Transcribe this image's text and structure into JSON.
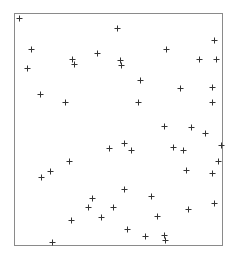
{
  "chart_data": {
    "type": "scatter",
    "title": "",
    "xlabel": "",
    "ylabel": "",
    "xlim": [
      0,
      1
    ],
    "ylim": [
      0,
      1
    ],
    "grid": false,
    "legend": null,
    "marker": "+",
    "series": [
      {
        "name": "points",
        "color": "#333333",
        "points": [
          {
            "x": 0.024,
            "y": 0.978
          },
          {
            "x": 0.495,
            "y": 0.935
          },
          {
            "x": 0.082,
            "y": 0.845
          },
          {
            "x": 0.279,
            "y": 0.802
          },
          {
            "x": 0.288,
            "y": 0.78
          },
          {
            "x": 0.399,
            "y": 0.828
          },
          {
            "x": 0.51,
            "y": 0.797
          },
          {
            "x": 0.514,
            "y": 0.776
          },
          {
            "x": 0.731,
            "y": 0.845
          },
          {
            "x": 0.962,
            "y": 0.884
          },
          {
            "x": 0.889,
            "y": 0.802
          },
          {
            "x": 0.971,
            "y": 0.802
          },
          {
            "x": 0.063,
            "y": 0.763
          },
          {
            "x": 0.606,
            "y": 0.711
          },
          {
            "x": 0.798,
            "y": 0.677
          },
          {
            "x": 0.952,
            "y": 0.681
          },
          {
            "x": 0.125,
            "y": 0.651
          },
          {
            "x": 0.245,
            "y": 0.616
          },
          {
            "x": 0.596,
            "y": 0.616
          },
          {
            "x": 0.952,
            "y": 0.616
          },
          {
            "x": 0.721,
            "y": 0.513
          },
          {
            "x": 0.851,
            "y": 0.509
          },
          {
            "x": 0.918,
            "y": 0.483
          },
          {
            "x": 0.457,
            "y": 0.418
          },
          {
            "x": 0.529,
            "y": 0.44
          },
          {
            "x": 0.563,
            "y": 0.41
          },
          {
            "x": 0.764,
            "y": 0.422
          },
          {
            "x": 0.813,
            "y": 0.41
          },
          {
            "x": 0.995,
            "y": 0.431
          },
          {
            "x": 0.981,
            "y": 0.362
          },
          {
            "x": 0.827,
            "y": 0.323
          },
          {
            "x": 0.952,
            "y": 0.31
          },
          {
            "x": 0.264,
            "y": 0.362
          },
          {
            "x": 0.173,
            "y": 0.319
          },
          {
            "x": 0.13,
            "y": 0.293
          },
          {
            "x": 0.529,
            "y": 0.241
          },
          {
            "x": 0.375,
            "y": 0.203
          },
          {
            "x": 0.476,
            "y": 0.164
          },
          {
            "x": 0.356,
            "y": 0.164
          },
          {
            "x": 0.418,
            "y": 0.121
          },
          {
            "x": 0.659,
            "y": 0.211
          },
          {
            "x": 0.837,
            "y": 0.155
          },
          {
            "x": 0.962,
            "y": 0.181
          },
          {
            "x": 0.274,
            "y": 0.108
          },
          {
            "x": 0.688,
            "y": 0.125
          },
          {
            "x": 0.543,
            "y": 0.069
          },
          {
            "x": 0.63,
            "y": 0.039
          },
          {
            "x": 0.721,
            "y": 0.043
          },
          {
            "x": 0.726,
            "y": 0.022
          },
          {
            "x": 0.183,
            "y": 0.013
          }
        ]
      }
    ]
  },
  "layout": {
    "frame": {
      "left": 14,
      "top": 13,
      "right": 222,
      "bottom": 245
    },
    "frame_color": "#8a8a8a",
    "marker_color": "#333333",
    "marker_size": 3
  }
}
